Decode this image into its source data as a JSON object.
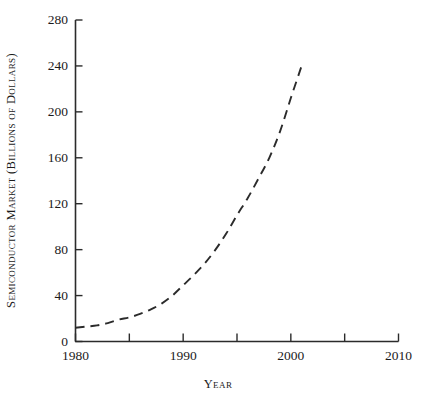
{
  "chart_data": {
    "type": "line",
    "title": "",
    "xlabel": "Year",
    "ylabel": "Semiconductor Market (Billions of Dollars)",
    "xlim": [
      1980,
      2010
    ],
    "ylim": [
      0,
      280
    ],
    "grid": false,
    "legend": null,
    "line_style": "dashed",
    "line_color": "#2b2b2b",
    "x_ticks": [
      1980,
      1985,
      1990,
      1995,
      2000,
      2005,
      2010
    ],
    "x_tick_labels": [
      "1980",
      "",
      "1990",
      "",
      "2000",
      "",
      "2010"
    ],
    "x_major_labels": [
      {
        "value": 1980,
        "label": "1980"
      },
      {
        "value": 1990,
        "label": "1990"
      },
      {
        "value": 2000,
        "label": "2000"
      },
      {
        "value": 2010,
        "label": "2010"
      }
    ],
    "y_ticks": [
      0,
      40,
      80,
      120,
      160,
      200,
      240,
      280
    ],
    "y_tick_labels": [
      "0",
      "40",
      "80",
      "120",
      "160",
      "200",
      "240",
      "280"
    ],
    "series": [
      {
        "name": "Semiconductor market",
        "x": [
          1980,
          1981,
          1982,
          1983,
          1984,
          1985,
          1986,
          1987,
          1988,
          1989,
          1990,
          1991,
          1992,
          1993,
          1994,
          1995,
          1996,
          1997,
          1998,
          1999,
          2000,
          2001
        ],
        "values": [
          12,
          13,
          14,
          16,
          19,
          21,
          24,
          28,
          33,
          40,
          49,
          58,
          68,
          80,
          94,
          110,
          125,
          142,
          160,
          183,
          212,
          240
        ]
      }
    ],
    "annotations": []
  }
}
